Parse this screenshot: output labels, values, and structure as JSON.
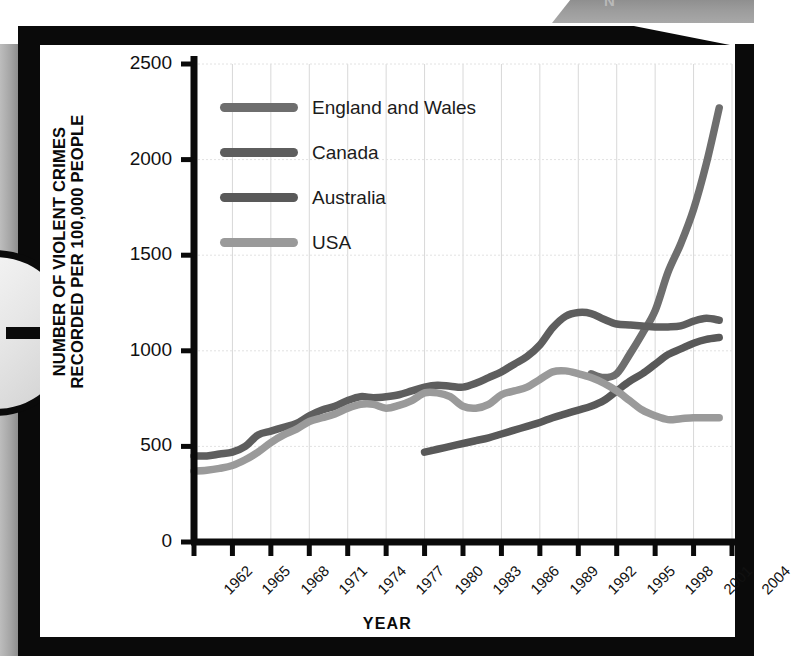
{
  "page": {
    "top_tab_text": "N",
    "arrow_icon": "arrow-right-icon"
  },
  "chart_data": {
    "type": "line",
    "title": "",
    "xlabel": "YEAR",
    "ylabel_line1": "NUMBER OF VIOLENT CRIMES",
    "ylabel_line2": "RECORDED PER 100,000 PEOPLE",
    "grid": true,
    "legend_position": "top-left-inside",
    "xlim": [
      1962,
      2004
    ],
    "ylim": [
      0,
      2500
    ],
    "yticks": [
      0,
      500,
      1000,
      1500,
      2000,
      2500
    ],
    "xticks": [
      1962,
      1965,
      1968,
      1971,
      1974,
      1977,
      1980,
      1983,
      1986,
      1989,
      1992,
      1995,
      1998,
      2001,
      2004
    ],
    "colors": {
      "england_and_wales": "#6e6e6e",
      "canada": "#5e5e5e",
      "australia": "#595959",
      "usa": "#9a9a9a"
    },
    "series": [
      {
        "name": "England and Wales",
        "color": "#6e6e6e",
        "x": [
          1993,
          1994,
          1995,
          1996,
          1997,
          1998,
          1999,
          2000,
          2001,
          2002,
          2003
        ],
        "values": [
          880,
          860,
          880,
          980,
          1090,
          1210,
          1410,
          1560,
          1740,
          1980,
          2270
        ]
      },
      {
        "name": "Canada",
        "color": "#5e5e5e",
        "x": [
          1962,
          1963,
          1964,
          1965,
          1966,
          1967,
          1968,
          1969,
          1970,
          1971,
          1972,
          1973,
          1974,
          1975,
          1976,
          1977,
          1978,
          1979,
          1980,
          1981,
          1982,
          1983,
          1984,
          1985,
          1986,
          1987,
          1988,
          1989,
          1990,
          1991,
          1992,
          1993,
          1994,
          1995,
          1996,
          1997,
          1998,
          1999,
          2000,
          2001,
          2002,
          2003
        ],
        "values": [
          450,
          450,
          460,
          470,
          500,
          560,
          580,
          600,
          620,
          660,
          690,
          710,
          740,
          760,
          755,
          760,
          770,
          790,
          810,
          820,
          815,
          810,
          830,
          860,
          890,
          930,
          970,
          1030,
          1120,
          1180,
          1200,
          1195,
          1165,
          1140,
          1135,
          1130,
          1125,
          1125,
          1130,
          1155,
          1170,
          1160
        ]
      },
      {
        "name": "Australia",
        "color": "#595959",
        "x": [
          1980,
          1981,
          1982,
          1983,
          1984,
          1985,
          1986,
          1987,
          1988,
          1989,
          1990,
          1991,
          1992,
          1993,
          1994,
          1995,
          1996,
          1997,
          1998,
          1999,
          2000,
          2001,
          2002,
          2003
        ],
        "values": [
          470,
          485,
          500,
          515,
          530,
          545,
          565,
          585,
          605,
          625,
          650,
          670,
          690,
          710,
          740,
          790,
          840,
          880,
          930,
          980,
          1010,
          1040,
          1060,
          1070
        ]
      },
      {
        "name": "USA",
        "color": "#9a9a9a",
        "x": [
          1962,
          1963,
          1964,
          1965,
          1966,
          1967,
          1968,
          1969,
          1970,
          1971,
          1972,
          1973,
          1974,
          1975,
          1976,
          1977,
          1978,
          1979,
          1980,
          1981,
          1982,
          1983,
          1984,
          1985,
          1986,
          1987,
          1988,
          1989,
          1990,
          1991,
          1992,
          1993,
          1994,
          1995,
          1996,
          1997,
          1998,
          1999,
          2000,
          2001,
          2002,
          2003
        ],
        "values": [
          370,
          375,
          385,
          400,
          430,
          470,
          520,
          560,
          590,
          630,
          650,
          670,
          700,
          720,
          720,
          700,
          715,
          740,
          780,
          780,
          760,
          710,
          700,
          720,
          770,
          790,
          810,
          850,
          890,
          895,
          880,
          860,
          830,
          790,
          740,
          690,
          660,
          640,
          645,
          650,
          650,
          650
        ]
      }
    ]
  },
  "legend": {
    "items": [
      {
        "label": "England and Wales",
        "color": "#6e6e6e"
      },
      {
        "label": "Canada",
        "color": "#5e5e5e"
      },
      {
        "label": "Australia",
        "color": "#595959"
      },
      {
        "label": "USA",
        "color": "#9a9a9a"
      }
    ]
  },
  "axis_labels": {
    "y": [
      "2500",
      "2000",
      "1500",
      "1000",
      "500",
      "0"
    ],
    "x": [
      "1962",
      "1965",
      "1968",
      "1971",
      "1974",
      "1977",
      "1980",
      "1983",
      "1986",
      "1989",
      "1992",
      "1995",
      "1998",
      "2001",
      "2004"
    ]
  }
}
